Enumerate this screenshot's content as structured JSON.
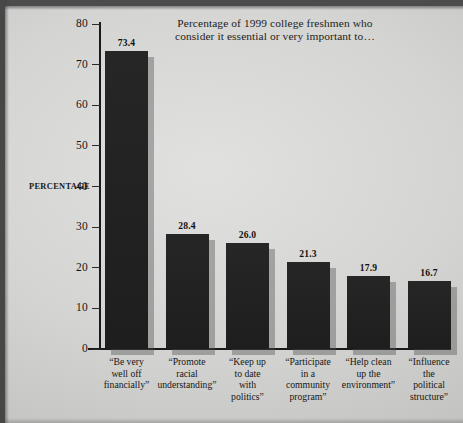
{
  "chart_data": {
    "type": "bar",
    "title": "Percentage of 1999 college freshmen who consider it essential or very important to…",
    "title_line_1": "Percentage of 1999 college freshmen who",
    "title_line_2": "consider it essential or very important to…",
    "xlabel": "",
    "ylabel": "PERCENTAGE",
    "ylim": [
      0,
      80
    ],
    "ytick_step": 10,
    "yticks": [
      0,
      10,
      20,
      30,
      40,
      50,
      60,
      70,
      80
    ],
    "ytick_labels": [
      "0",
      "10",
      "20",
      "30",
      "40",
      "50",
      "60",
      "70",
      "80"
    ],
    "grid": false,
    "legend": false,
    "categories": [
      "“Be very well off financially”",
      "“Promote racial understanding”",
      "“Keep up to date with politics”",
      "“Participate in a community program”",
      "“Help clean up the environment”",
      "“Influence the political structure”"
    ],
    "values": [
      73.4,
      28.4,
      26.0,
      21.3,
      17.9,
      16.7
    ],
    "value_labels": [
      "73.4",
      "28.4",
      "26.0",
      "21.3",
      "17.9",
      "16.7"
    ],
    "bar_color": "#242424",
    "background_color": "#cbcbc9",
    "axis_color": "#1a1a1a"
  },
  "bars": [
    {
      "value_label": "73.4",
      "label_lines": [
        "“Be very",
        "well off",
        "financially”"
      ]
    },
    {
      "value_label": "28.4",
      "label_lines": [
        "“Promote",
        "racial",
        "understanding”"
      ]
    },
    {
      "value_label": "26.0",
      "label_lines": [
        "“Keep up",
        "to date",
        "with",
        "politics”"
      ]
    },
    {
      "value_label": "21.3",
      "label_lines": [
        "“Participate",
        "in a",
        "community",
        "program”"
      ]
    },
    {
      "value_label": "17.9",
      "label_lines": [
        "“Help clean",
        "up the",
        "environment”"
      ]
    },
    {
      "value_label": "16.7",
      "label_lines": [
        "“Influence",
        "the",
        "political",
        "structure”"
      ]
    }
  ]
}
